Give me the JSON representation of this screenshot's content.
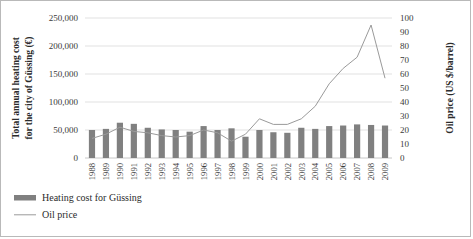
{
  "chart_data": {
    "type": "bar",
    "title": "",
    "categories": [
      "1988",
      "1989",
      "1990",
      "1991",
      "1992",
      "1993",
      "1994",
      "1995",
      "1996",
      "1997",
      "1998",
      "1999",
      "2000",
      "2001",
      "2002",
      "2003",
      "2004",
      "2005",
      "2006",
      "2007",
      "2008",
      "2009"
    ],
    "series": [
      {
        "name": "Heating cost for Güssing",
        "type": "bar",
        "axis": "left",
        "unit": "€",
        "color": "#808080",
        "values": [
          50000,
          52000,
          63000,
          61000,
          54000,
          51000,
          50000,
          47000,
          57000,
          50000,
          53000,
          38000,
          50000,
          46000,
          45000,
          54000,
          52000,
          57000,
          58000,
          60000,
          59000,
          58000
        ]
      },
      {
        "name": "Oil price",
        "type": "line",
        "axis": "right",
        "unit": "US $/barrel",
        "color": "#9a9a9a",
        "values": [
          14,
          17,
          22,
          19,
          18,
          16,
          15,
          16,
          20,
          18,
          12,
          17,
          28,
          24,
          24,
          28,
          37,
          53,
          64,
          72,
          95,
          57
        ]
      }
    ],
    "ylabel": "Total annual heating cost for the city of Güssing (€)",
    "ylabel_right": "Oil price (US $/barrel)",
    "xlabel": "",
    "ylim": [
      0,
      250000
    ],
    "ylim_right": [
      0,
      100
    ],
    "yticks": [
      "0",
      "50,000",
      "100,000",
      "150,000",
      "200,000",
      "250,000"
    ],
    "ytick_values": [
      0,
      50000,
      100000,
      150000,
      200000,
      250000
    ],
    "yticks_right": [
      "0",
      "10",
      "20",
      "30",
      "40",
      "50",
      "60",
      "70",
      "80",
      "90",
      "100"
    ],
    "ytick_values_right": [
      0,
      10,
      20,
      30,
      40,
      50,
      60,
      70,
      80,
      90,
      100
    ],
    "grid": true,
    "legend_position": "bottom-left"
  },
  "legend": {
    "items": [
      {
        "label": "Heating cost for Güssing",
        "marker": "bar-swatch",
        "color": "#808080"
      },
      {
        "label": "Oil price",
        "marker": "line-swatch",
        "color": "#9a9a9a"
      }
    ]
  }
}
